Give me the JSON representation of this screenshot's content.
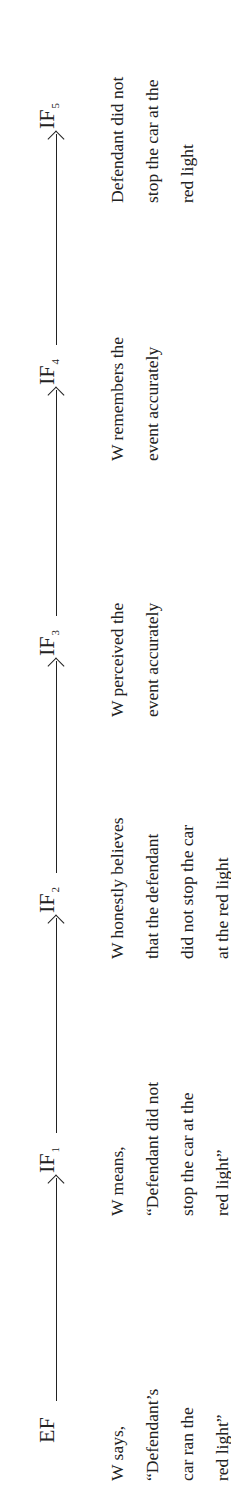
{
  "diagram": {
    "type": "inference-chain",
    "orientation": "rotated-90-ccw",
    "nodes": [
      {
        "id": "EF",
        "label": "EF",
        "sub": "",
        "description": [
          "W says,",
          "“Defendant’s",
          "car ran the",
          "red light”"
        ]
      },
      {
        "id": "IF1",
        "label": "IF",
        "sub": "1",
        "description": [
          "W means,",
          "“Defendant did not",
          "stop the car at the",
          "red light”"
        ]
      },
      {
        "id": "IF2",
        "label": "IF",
        "sub": "2",
        "description": [
          "W honestly believes",
          "that the defendant",
          "did not stop the car",
          "at the red light"
        ]
      },
      {
        "id": "IF3",
        "label": "IF",
        "sub": "3",
        "description": [
          "W perceived the",
          "event accurately"
        ]
      },
      {
        "id": "IF4",
        "label": "IF",
        "sub": "4",
        "description": [
          "W remembers the",
          "event accurately"
        ]
      },
      {
        "id": "IF5",
        "label": "IF",
        "sub": "5",
        "description": [
          "Defendant did not",
          "stop the car at the",
          "red light"
        ]
      }
    ],
    "edges": [
      {
        "from": "EF",
        "to": "IF1"
      },
      {
        "from": "IF1",
        "to": "IF2"
      },
      {
        "from": "IF2",
        "to": "IF3"
      },
      {
        "from": "IF3",
        "to": "IF4"
      },
      {
        "from": "IF4",
        "to": "IF5"
      }
    ]
  }
}
